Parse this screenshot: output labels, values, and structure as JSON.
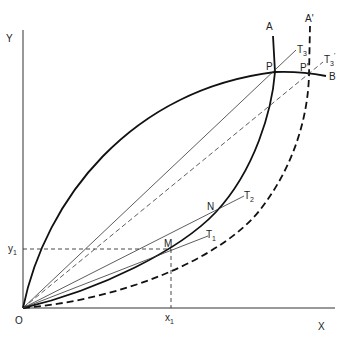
{
  "diagram": {
    "axes": {
      "x_label": "X",
      "y_label": "Y",
      "origin_label": "O",
      "x1_label": "x",
      "x1_sub": "1",
      "y1_label": "y",
      "y1_sub": "1"
    },
    "curves": {
      "A": "A",
      "A_prime": "A'",
      "B": "B"
    },
    "points": {
      "P": "P",
      "P_prime": "P'",
      "N": "N",
      "M": "M"
    },
    "tangents": {
      "T1": "T",
      "T1_sub": "1",
      "T2": "T",
      "T2_sub": "2",
      "T3": "T",
      "T3_sub": "3",
      "T3p": "T",
      "T3p_sub": "3",
      "T3p_sup": "'"
    }
  }
}
